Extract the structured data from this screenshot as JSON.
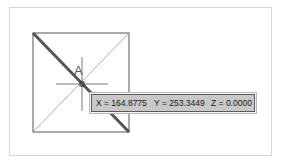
{
  "viewport": {
    "background": "#ffffff",
    "frame_border": "#d6d6d6"
  },
  "drawing": {
    "square": {
      "x1": 33,
      "y1": 33,
      "x2": 129,
      "y2": 132,
      "color": "#555555"
    },
    "selected_line": {
      "from": [
        33,
        33
      ],
      "to": [
        129,
        132
      ],
      "color": "#555555",
      "width": 3
    },
    "thin_diagonal": {
      "from": [
        33,
        132
      ],
      "to": [
        129,
        33
      ],
      "color": "#999999"
    },
    "crosshair": {
      "cx": 82,
      "cy": 84,
      "half_h": 26,
      "half_v": 27,
      "color": "#555555"
    },
    "pickbox_size": 4,
    "point_label": "A"
  },
  "tooltip": {
    "x_text": "X = 164.8775",
    "y_text": "Y = 253.3449",
    "z_text": "Z = 0.0000",
    "background": "#c8c8c8",
    "border": "#5a5a5a"
  }
}
